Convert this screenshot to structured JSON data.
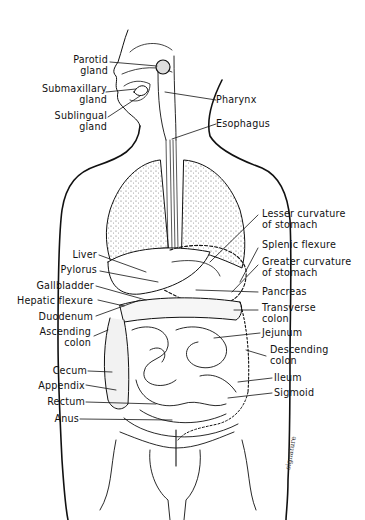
{
  "colors": {
    "line": "#111111",
    "background": "#ffffff",
    "stipple": "#555555"
  },
  "labels_left": [
    {
      "id": "parotid",
      "text": "Parotid\ngland"
    },
    {
      "id": "submaxillary",
      "text": "Submaxillary\ngland"
    },
    {
      "id": "sublingual",
      "text": "Sublingual\ngland"
    },
    {
      "id": "liver",
      "text": "Liver"
    },
    {
      "id": "pylorus",
      "text": "Pylorus"
    },
    {
      "id": "gallbladder",
      "text": "Gallbladder"
    },
    {
      "id": "hepatic_flexure",
      "text": "Hepatic flexure"
    },
    {
      "id": "duodenum",
      "text": "Duodenum"
    },
    {
      "id": "ascending_colon",
      "text": "Ascending\ncolon"
    },
    {
      "id": "cecum",
      "text": "Cecum"
    },
    {
      "id": "appendix",
      "text": "Appendix"
    },
    {
      "id": "rectum",
      "text": "Rectum"
    },
    {
      "id": "anus",
      "text": "Anus"
    }
  ],
  "labels_right": [
    {
      "id": "pharynx",
      "text": "Pharynx"
    },
    {
      "id": "esophagus",
      "text": "Esophagus"
    },
    {
      "id": "lesser_curvature",
      "text": "Lesser curvature\nof stomach"
    },
    {
      "id": "splenic_flexure",
      "text": "Splenic flexure"
    },
    {
      "id": "greater_curvature",
      "text": "Greater curvature\nof stomach"
    },
    {
      "id": "pancreas",
      "text": "Pancreas"
    },
    {
      "id": "transverse_colon",
      "text": "Transverse\ncolon"
    },
    {
      "id": "jejunum",
      "text": "Jejunum"
    },
    {
      "id": "descending_colon",
      "text": "Descending\ncolon"
    },
    {
      "id": "ileum",
      "text": "Ileum"
    },
    {
      "id": "sigmoid",
      "text": "Sigmoid"
    }
  ]
}
